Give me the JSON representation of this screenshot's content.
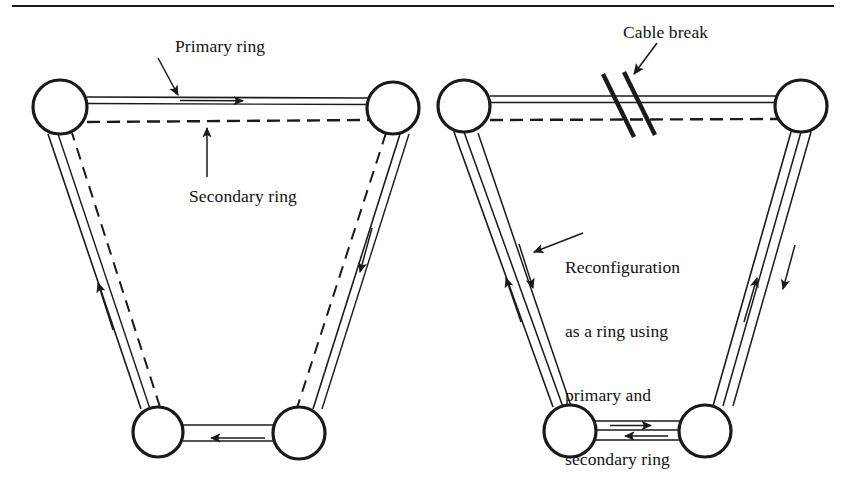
{
  "figure": {
    "type": "network-diagram",
    "title_rule": true
  },
  "labels": {
    "primary_ring": "Primary ring",
    "secondary_ring": "Secondary ring",
    "cable_break": "Cable break",
    "reconfiguration_line1": "Reconfiguration",
    "reconfiguration_line2": "as a ring using",
    "reconfiguration_line3": "primary and",
    "reconfiguration_line4": "secondary ring"
  },
  "colors": {
    "ink": "#1a1a1a",
    "paper": "#ffffff"
  },
  "left_diagram": {
    "name": "normal-dual-ring",
    "nodes": [
      {
        "id": "L-top-left",
        "cx": 60,
        "cy": 107,
        "r": 27
      },
      {
        "id": "L-top-right",
        "cx": 393,
        "cy": 108,
        "r": 26
      },
      {
        "id": "L-bottom-left",
        "cx": 158,
        "cy": 432,
        "r": 25
      },
      {
        "id": "L-bottom-right",
        "cx": 299,
        "cy": 433,
        "r": 26
      }
    ],
    "primary_ring_style": "solid",
    "secondary_ring_style": "dashed",
    "arrow_count": 4
  },
  "right_diagram": {
    "name": "reconfigured-ring-after-break",
    "nodes": [
      {
        "id": "R-top-left",
        "cx": 464,
        "cy": 106,
        "r": 26
      },
      {
        "id": "R-top-right",
        "cx": 801,
        "cy": 106,
        "r": 26
      },
      {
        "id": "R-bottom-left",
        "cx": 570,
        "cy": 431,
        "r": 26
      },
      {
        "id": "R-bottom-right",
        "cx": 705,
        "cy": 431,
        "r": 26
      }
    ],
    "break_marker": {
      "x": 637,
      "y": 106,
      "slashes": 2
    },
    "primary_ring_style": "solid",
    "secondary_ring_style": "dashed",
    "arrow_count": 6
  }
}
